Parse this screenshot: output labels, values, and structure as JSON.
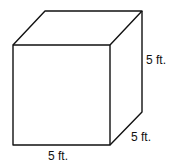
{
  "diagram": {
    "shape": "cube",
    "labels": {
      "height": "5 ft.",
      "depth": "5 ft.",
      "width": "5 ft."
    },
    "stroke_color": "#111111",
    "background": "#ffffff"
  }
}
